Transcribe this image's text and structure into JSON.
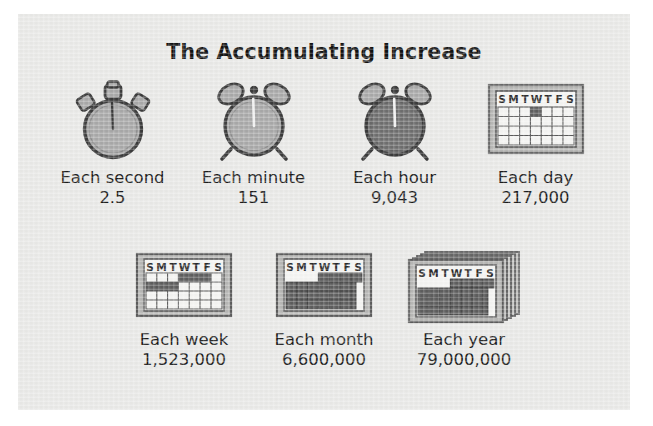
{
  "panel": {
    "background_color": "#e9e9e7",
    "page_background_color": "#ffffff"
  },
  "title": "The Accumulating Increase",
  "colors": {
    "text": "#1a1a1a",
    "title": "#111111",
    "icon_outline": "#3a3a3a",
    "clock_face_light": "#a8a8a8",
    "clock_face_dark": "#6e6e6e",
    "calendar_frame": "#9a9a9a",
    "calendar_paper": "#f2f2f0",
    "calendar_cell_fill": "#6e6e6e"
  },
  "rows": [
    {
      "name": "top-row",
      "items": [
        {
          "icon": "stopwatch-icon",
          "label": "Each second",
          "value": "2.5"
        },
        {
          "icon": "alarm-clock-icon",
          "label": "Each minute",
          "value": "151"
        },
        {
          "icon": "alarm-clock-dark-icon",
          "label": "Each hour",
          "value": "9,043"
        },
        {
          "icon": "calendar-day-icon",
          "label": "Each day",
          "value": "217,000"
        }
      ]
    },
    {
      "name": "bottom-row",
      "items": [
        {
          "icon": "calendar-week-icon",
          "label": "Each week",
          "value": "1,523,000"
        },
        {
          "icon": "calendar-month-icon",
          "label": "Each month",
          "value": "6,600,000"
        },
        {
          "icon": "calendar-year-stack-icon",
          "label": "Each year",
          "value": "79,000,000"
        }
      ]
    }
  ],
  "calendar_header_days": [
    "S",
    "M",
    "T",
    "W",
    "T",
    "F",
    "S"
  ]
}
